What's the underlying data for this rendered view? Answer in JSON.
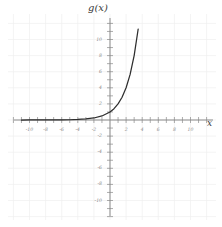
{
  "chart_data": {
    "type": "line",
    "title": "g(x)",
    "xlabel": "x",
    "ylabel": "",
    "xlim": [
      -11,
      11
    ],
    "ylim": [
      -11,
      11.5
    ],
    "grid": true,
    "legend": null,
    "axis_color": "#8a8a8a",
    "curve_color": "#2e2e2e",
    "grid_color": "#efefef",
    "background": "#ffffff",
    "x_ticks_labeled": [
      -10,
      -8,
      -6,
      -4,
      -2,
      2,
      4,
      6,
      8,
      10
    ],
    "x_tick_labels": [
      "-10",
      "-8",
      "-6",
      "-4",
      "-2",
      "2",
      "4",
      "6",
      "8",
      "10"
    ],
    "y_ticks_labeled": [
      -10,
      -8,
      -6,
      -4,
      -2,
      2,
      4,
      6,
      8,
      10
    ],
    "y_tick_labels": [
      "-10",
      "-8",
      "-6",
      "-4",
      "-2",
      "2",
      "4",
      "6",
      "8",
      "10"
    ],
    "tick_step": 1,
    "series": [
      {
        "name": "g(x)",
        "description": "exponential growth curve asymptotic to y=0 as x decreases",
        "x": [
          -11,
          -10,
          -9,
          -8,
          -7,
          -6,
          -5,
          -4,
          -3,
          -2,
          -1,
          0,
          0.5,
          1,
          1.5,
          2,
          2.5,
          3,
          3.5,
          4,
          4.3
        ],
        "y": [
          0.0005,
          0.001,
          0.002,
          0.004,
          0.008,
          0.016,
          0.031,
          0.063,
          0.125,
          0.25,
          0.5,
          1,
          1.41,
          2,
          2.83,
          4,
          5.66,
          8,
          11.3,
          16,
          19.7
        ]
      }
    ]
  }
}
